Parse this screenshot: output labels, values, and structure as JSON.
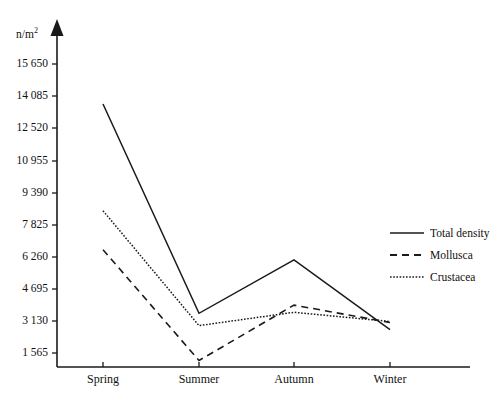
{
  "chart_data": {
    "type": "line",
    "title": "",
    "xlabel": "",
    "ylabel": "n/m2",
    "ylabel_display": "n/m",
    "ylabel_superscript": "2",
    "categories": [
      "Spring",
      "Summer",
      "Autumn",
      "Winter"
    ],
    "ytick_labels": [
      "15 650",
      "14 085",
      "12 520",
      "10 955",
      "9 390",
      "7 825",
      "6 260",
      "4 695",
      "3 130",
      "1 565"
    ],
    "ytick_values": [
      15650,
      14085,
      12520,
      10955,
      9390,
      7825,
      6260,
      4695,
      3130,
      1565
    ],
    "ylim": [
      0,
      16450
    ],
    "grid": false,
    "legend_position": "right",
    "series": [
      {
        "name": "Total density",
        "style": "solid",
        "color": "#1a1a1a",
        "values": [
          13700,
          3500,
          6100,
          2700
        ]
      },
      {
        "name": "Mollusca",
        "style": "dashed",
        "color": "#1a1a1a",
        "values": [
          6600,
          1200,
          3900,
          3050
        ]
      },
      {
        "name": "Crustacea",
        "style": "dotted",
        "color": "#1a1a1a",
        "values": [
          8500,
          2900,
          3550,
          3100
        ]
      }
    ]
  },
  "legend": {
    "items": [
      {
        "label": "Total density",
        "style": "solid"
      },
      {
        "label": "Mollusca",
        "style": "dashed"
      },
      {
        "label": "Crustacea",
        "style": "dotted"
      }
    ]
  },
  "axes": {
    "unit_label": "n/m",
    "unit_superscript": "2"
  }
}
